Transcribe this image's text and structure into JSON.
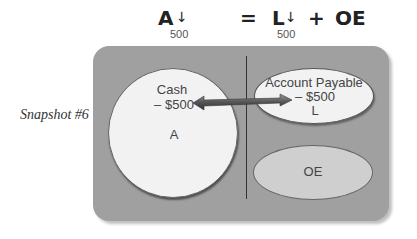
{
  "equation": {
    "assets": "A",
    "assets_arrow": "↓",
    "assets_change": "500",
    "equals": "=",
    "liabilities": "L",
    "liabilities_arrow": "↓",
    "liabilities_change": "500",
    "plus": "+",
    "owners_equity": "OE"
  },
  "snapshot_label": "Snapshot #6",
  "assets_box": {
    "account": "Cash",
    "change": "– $500",
    "category": "A"
  },
  "liabilities_box": {
    "account": "Account Payable",
    "change": "– $500",
    "category": "L"
  },
  "equity_box": {
    "category": "OE"
  },
  "colors": {
    "panel": "#a0a0a0",
    "asset_fill": "#f2f2f2",
    "equity_fill": "#cfcfcf",
    "arrow": "#555555"
  }
}
